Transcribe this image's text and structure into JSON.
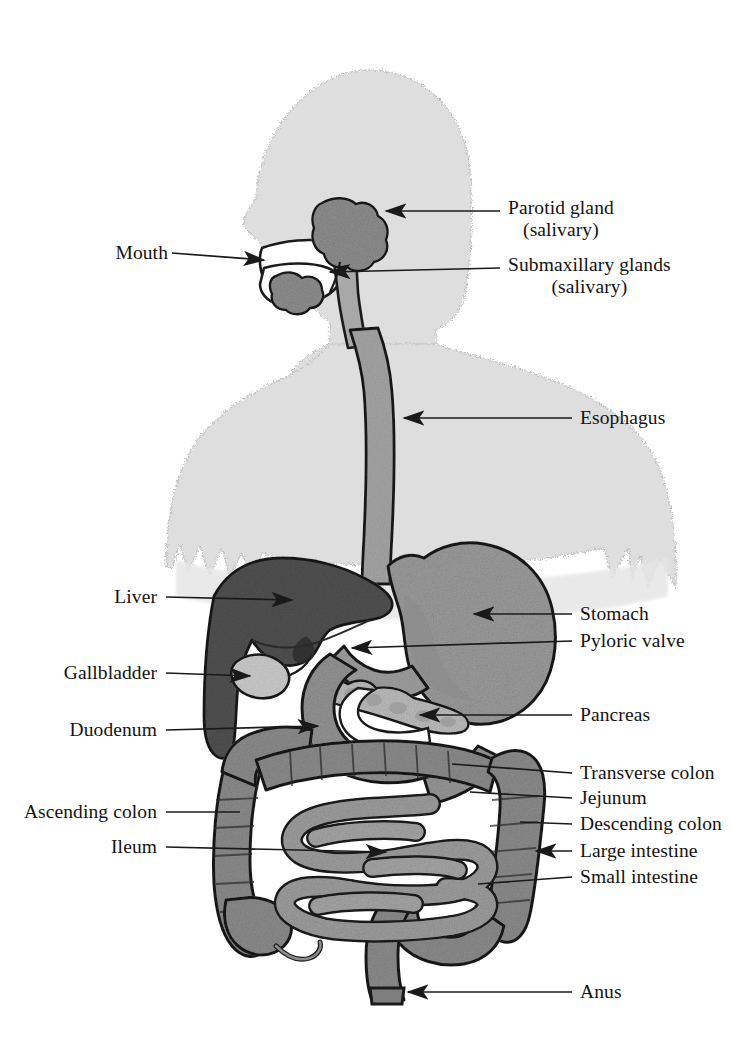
{
  "figure": {
    "background_color": "#ffffff",
    "body_silhouette_color": "#dcdcdc",
    "organ_mid_color": "#9a9a9a",
    "organ_dark_color": "#4f4f4f",
    "organ_light_color": "#c9c9c9",
    "outline_color": "#1a1a1a",
    "leader_color": "#1a1a1a"
  },
  "labels": {
    "parotid_gland": "Parotid gland",
    "parotid_gland_sub": "(salivary)",
    "submaxillary_glands": "Submaxillary glands",
    "submaxillary_glands_sub": "(salivary)",
    "mouth": "Mouth",
    "esophagus": "Esophagus",
    "liver": "Liver",
    "stomach": "Stomach",
    "pyloric_valve": "Pyloric valve",
    "gallbladder": "Gallbladder",
    "pancreas": "Pancreas",
    "duodenum": "Duodenum",
    "transverse_colon": "Transverse colon",
    "jejunum": "Jejunum",
    "ascending_colon": "Ascending colon",
    "descending_colon": "Descending colon",
    "ileum": "Ileum",
    "large_intestine": "Large intestine",
    "small_intestine": "Small intestine",
    "anus": "Anus"
  }
}
